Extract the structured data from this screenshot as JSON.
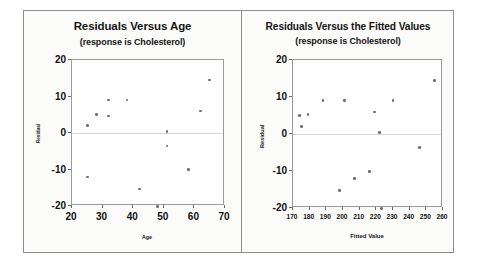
{
  "figure": {
    "background_color": "#fbfbfa",
    "border_color": "#8d8d8d",
    "point_color": "#6f6f72"
  },
  "chart_data": [
    {
      "type": "scatter",
      "panel": "left",
      "title": "Residuals Versus Age",
      "subtitle": "(response is Cholesterol)",
      "xlabel": "Age",
      "ylabel": "Residual",
      "xlim": [
        20,
        70
      ],
      "ylim": [
        -20,
        20
      ],
      "xticks": [
        20,
        30,
        40,
        50,
        60,
        70
      ],
      "yticks": [
        20,
        10,
        0,
        -10,
        -20
      ],
      "xticklabels": [
        "20",
        "30",
        "40",
        "50",
        "60",
        "70"
      ],
      "yticklabels": [
        "20",
        "10",
        "0",
        "-10",
        "-20"
      ],
      "grid": false,
      "zero_reference_line": true,
      "legend": null,
      "x": [
        25,
        25,
        28,
        32,
        32,
        38,
        42,
        48,
        51,
        51,
        58,
        62,
        65
      ],
      "y": [
        2,
        -12,
        5,
        9,
        4.7,
        9,
        -15.3,
        -20.2,
        0.4,
        -3.6,
        -10,
        6,
        14.5
      ]
    },
    {
      "type": "scatter",
      "panel": "right",
      "title": "Residuals Versus the Fitted Values",
      "subtitle": "(response is Cholesterol)",
      "xlabel": "Fitted Value",
      "ylabel": "Residual",
      "xlim": [
        170,
        260
      ],
      "ylim": [
        -20,
        20
      ],
      "xticks": [
        170,
        180,
        190,
        200,
        210,
        220,
        230,
        240,
        250,
        260
      ],
      "yticks": [
        20,
        10,
        0,
        -10,
        -20
      ],
      "xticklabels": [
        "170",
        "180",
        "190",
        "200",
        "210",
        "220",
        "230",
        "240",
        "250",
        "260"
      ],
      "yticklabels": [
        "20",
        "10",
        "0",
        "-10",
        "-20"
      ],
      "grid": false,
      "zero_reference_line": true,
      "legend": null,
      "x": [
        174,
        175,
        179,
        188,
        198,
        201,
        207,
        216,
        219,
        222,
        223,
        230,
        246,
        255
      ],
      "y": [
        5,
        2,
        5.2,
        9,
        -15.3,
        9,
        -12,
        -10.2,
        6,
        0.4,
        -20.2,
        9,
        -3.6,
        14.5
      ]
    }
  ]
}
